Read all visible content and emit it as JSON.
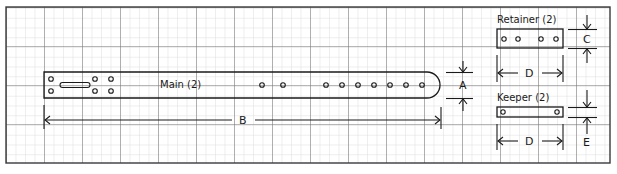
{
  "diagram": {
    "colors": {
      "grid_minor": "#d4d4d4",
      "grid_major": "#6a6a6a",
      "outline": "#1a1a1a",
      "background": "#ffffff"
    },
    "parts": {
      "main": {
        "label": "Main (2)",
        "end_holes": 6,
        "slot": 1,
        "adjust_holes": 9
      },
      "retainer": {
        "label": "Retainer (2)",
        "holes": 4
      },
      "keeper": {
        "label": "Keeper (2)",
        "holes": 2
      }
    },
    "dimensions": {
      "A": "A",
      "B": "B",
      "C": "C",
      "D_retainer": "D",
      "D_keeper": "D",
      "E": "E"
    }
  }
}
